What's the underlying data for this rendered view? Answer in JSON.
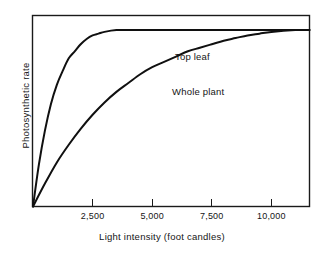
{
  "chart_data": {
    "type": "line",
    "title": "",
    "subtitle": "",
    "xlabel": "Light intensity (foot candles)",
    "ylabel": "Photosynthetic rate",
    "xlim": [
      0,
      11600
    ],
    "ylim": [
      0,
      1.08
    ],
    "grid": false,
    "legend_position": "inline-annotations",
    "xticks": [
      2500,
      5000,
      7500,
      10000
    ],
    "xtick_labels": [
      "2,500",
      "5,000",
      "7,500",
      "10,000"
    ],
    "yticks": [],
    "ytick_labels": [],
    "y_axis_note": "unlabeled relative scale",
    "series": [
      {
        "name": "Top leaf",
        "saturation_value": 1.0,
        "half_saturation_x": 700,
        "x": [
          0,
          250,
          500,
          750,
          1000,
          1250,
          1500,
          1750,
          2000,
          2250,
          2500,
          2750,
          3000,
          3500,
          4000,
          5000,
          6000,
          7000,
          8000,
          9000,
          10000,
          11000,
          11600
        ],
        "values": [
          0.0,
          0.24,
          0.43,
          0.58,
          0.69,
          0.77,
          0.84,
          0.88,
          0.92,
          0.95,
          0.97,
          0.98,
          0.99,
          1.0,
          1.0,
          1.0,
          1.0,
          1.0,
          1.0,
          1.0,
          1.0,
          1.0,
          1.0
        ]
      },
      {
        "name": "Whole plant",
        "saturation_value": 1.0,
        "half_saturation_x": 2600,
        "x": [
          0,
          500,
          1000,
          1500,
          2000,
          2500,
          3000,
          3500,
          4000,
          4500,
          5000,
          5500,
          6000,
          6500,
          7000,
          7500,
          8000,
          8500,
          9000,
          9500,
          10000,
          11000,
          11600
        ],
        "values": [
          0.0,
          0.13,
          0.25,
          0.35,
          0.44,
          0.52,
          0.59,
          0.65,
          0.7,
          0.75,
          0.79,
          0.82,
          0.85,
          0.88,
          0.9,
          0.92,
          0.94,
          0.955,
          0.97,
          0.98,
          0.99,
          1.0,
          1.0
        ]
      }
    ],
    "annotations": [
      {
        "text": "Top leaf",
        "x_px": 175,
        "y_px": 51
      },
      {
        "text": "Whole plant",
        "x_px": 172,
        "y_px": 86
      }
    ],
    "style": {
      "line_color": "#101010",
      "frame_color": "#1a1a1a",
      "background": "#ffffff",
      "line_width": 2
    }
  },
  "axes": {
    "x_title": "Light intensity (foot candles)",
    "y_title": "Photosynthetic rate"
  },
  "tick_labels": {
    "x": [
      "2,500",
      "5,000",
      "7,500",
      "10,000"
    ]
  },
  "curve_labels": {
    "top_leaf": "Top leaf",
    "whole_plant": "Whole plant"
  }
}
